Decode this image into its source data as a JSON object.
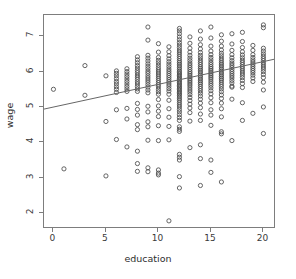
{
  "chart_data": {
    "type": "scatter",
    "title": "",
    "xlabel": "education",
    "ylabel": "wage",
    "xlim": [
      -0.9,
      21.2
    ],
    "ylim": [
      1.55,
      7.6
    ],
    "xticks": [
      0,
      5,
      10,
      15,
      20
    ],
    "yticks": [
      2,
      3,
      4,
      5,
      6,
      7
    ],
    "grid": false,
    "legend": null,
    "marker": {
      "shape": "open-circle",
      "size_px": 4.2,
      "color": "#4a4a4a"
    },
    "fit_line": {
      "kind": "linear-regression",
      "color": "#666666",
      "x_start": -0.9,
      "y_start": 4.94,
      "x_end": 21.2,
      "y_end": 6.36,
      "slope": 0.0643,
      "intercept": 4.998
    },
    "series": [
      {
        "name": "observations",
        "columns": [
          {
            "x": 0,
            "y": [
              5.5
            ]
          },
          {
            "x": 1,
            "y": [
              3.25
            ]
          },
          {
            "x": 3,
            "y": [
              6.17,
              5.33
            ]
          },
          {
            "x": 5,
            "y": [
              5.88,
              4.59,
              3.05
            ]
          },
          {
            "x": 6,
            "y": [
              6.02,
              5.95,
              5.88,
              5.8,
              5.72,
              5.65,
              5.57,
              5.5,
              5.41,
              4.92,
              4.08
            ]
          },
          {
            "x": 7,
            "y": [
              6.08,
              6.0,
              5.93,
              5.86,
              5.79,
              5.72,
              5.65,
              5.58,
              5.51,
              5.44,
              4.96,
              4.66,
              3.87
            ]
          },
          {
            "x": 8,
            "y": [
              6.42,
              6.33,
              6.25,
              6.17,
              6.1,
              6.03,
              5.97,
              5.9,
              5.84,
              5.78,
              5.71,
              5.65,
              5.58,
              5.51,
              5.44,
              5.1,
              4.93,
              4.77,
              4.5,
              4.36,
              3.75,
              3.4,
              3.18
            ]
          },
          {
            "x": 9,
            "y": [
              7.26,
              6.89,
              6.46,
              6.38,
              6.3,
              6.22,
              6.15,
              6.08,
              6.01,
              5.95,
              5.88,
              5.82,
              5.76,
              5.7,
              5.63,
              5.56,
              5.48,
              5.4,
              5.02,
              4.86,
              4.58,
              4.44,
              4.06,
              3.28,
              3.17
            ]
          },
          {
            "x": 10,
            "y": [
              6.79,
              6.55,
              6.4,
              6.32,
              6.25,
              6.18,
              6.11,
              6.05,
              5.99,
              5.93,
              5.87,
              5.81,
              5.75,
              5.69,
              5.63,
              5.57,
              5.5,
              5.43,
              5.36,
              5.21,
              5.03,
              4.88,
              4.73,
              4.47,
              4.05,
              3.22,
              3.13,
              3.08
            ]
          },
          {
            "x": 11,
            "y": [
              6.7,
              6.56,
              6.45,
              6.36,
              6.28,
              6.21,
              6.14,
              6.07,
              6.01,
              5.95,
              5.89,
              5.83,
              5.77,
              5.71,
              5.65,
              5.59,
              5.52,
              5.45,
              5.36,
              5.19,
              4.95,
              4.71,
              4.45,
              4.07,
              1.78
            ]
          },
          {
            "x": 12,
            "y": [
              7.22,
              7.15,
              7.07,
              6.98,
              6.9,
              6.82,
              6.75,
              6.68,
              6.61,
              6.55,
              6.49,
              6.43,
              6.37,
              6.31,
              6.26,
              6.21,
              6.16,
              6.11,
              6.06,
              6.01,
              5.97,
              5.93,
              5.89,
              5.85,
              5.81,
              5.77,
              5.73,
              5.69,
              5.65,
              5.61,
              5.57,
              5.53,
              5.49,
              5.45,
              5.41,
              5.37,
              5.33,
              5.28,
              5.23,
              5.18,
              5.12,
              5.06,
              5.0,
              4.93,
              4.86,
              4.78,
              4.7,
              4.62,
              4.44,
              4.37,
              4.31,
              3.66,
              3.58,
              3.5,
              3.03,
              2.71
            ]
          },
          {
            "x": 13,
            "y": [
              6.98,
              6.8,
              6.66,
              6.55,
              6.46,
              6.38,
              6.31,
              6.24,
              6.18,
              6.12,
              6.06,
              6.0,
              5.95,
              5.9,
              5.85,
              5.8,
              5.75,
              5.7,
              5.65,
              5.6,
              5.54,
              5.48,
              5.42,
              5.35,
              5.27,
              5.18,
              5.08,
              4.97,
              4.84,
              4.6,
              3.85
            ]
          },
          {
            "x": 14,
            "y": [
              7.15,
              6.92,
              6.76,
              6.64,
              6.54,
              6.46,
              6.39,
              6.32,
              6.26,
              6.2,
              6.14,
              6.09,
              6.04,
              5.99,
              5.94,
              5.89,
              5.84,
              5.79,
              5.74,
              5.69,
              5.64,
              5.58,
              5.52,
              5.46,
              5.39,
              5.31,
              5.22,
              5.11,
              4.98,
              4.8,
              4.62,
              3.93,
              3.54,
              2.78
            ]
          },
          {
            "x": 15,
            "y": [
              7.26,
              6.95,
              6.72,
              6.58,
              6.48,
              6.4,
              6.33,
              6.26,
              6.2,
              6.14,
              6.09,
              6.04,
              5.99,
              5.94,
              5.89,
              5.84,
              5.79,
              5.73,
              5.67,
              5.61,
              5.54,
              5.46,
              5.37,
              5.26,
              5.12,
              4.92,
              4.77,
              4.48,
              3.5,
              3.15
            ]
          },
          {
            "x": 16,
            "y": [
              7.04,
              6.86,
              6.72,
              6.61,
              6.52,
              6.45,
              6.38,
              6.32,
              6.26,
              6.21,
              6.16,
              6.11,
              6.06,
              6.01,
              5.96,
              5.91,
              5.86,
              5.81,
              5.76,
              5.7,
              5.64,
              5.58,
              5.51,
              5.43,
              5.34,
              5.24,
              5.11,
              4.95,
              4.72,
              4.3,
              4.24,
              2.88
            ]
          },
          {
            "x": 17,
            "y": [
              7.07,
              6.78,
              6.6,
              6.48,
              6.39,
              6.31,
              6.24,
              6.18,
              6.12,
              6.06,
              6.0,
              5.94,
              5.88,
              5.82,
              5.75,
              5.68,
              5.59,
              5.56,
              5.22,
              4.05
            ]
          },
          {
            "x": 18,
            "y": [
              7.11,
              6.85,
              6.68,
              6.56,
              6.47,
              6.39,
              6.32,
              6.26,
              6.2,
              6.14,
              6.08,
              6.02,
              5.96,
              5.9,
              5.83,
              5.75,
              5.66,
              5.55,
              5.12,
              4.62
            ]
          },
          {
            "x": 19,
            "y": [
              6.74,
              6.6,
              6.48,
              6.4,
              6.33,
              6.27,
              6.21,
              6.15,
              6.09,
              6.03,
              5.97,
              5.9,
              5.82,
              5.72,
              4.82
            ]
          },
          {
            "x": 20,
            "y": [
              7.32,
              7.24,
              6.66,
              6.58,
              6.5,
              6.43,
              6.37,
              6.31,
              6.25,
              6.19,
              6.13,
              6.07,
              6.0,
              5.92,
              5.83,
              5.7,
              5.48,
              5.0,
              4.25
            ]
          }
        ]
      }
    ]
  },
  "axes": {
    "y_tick_labels": [
      "7",
      "6",
      "5",
      "4",
      "3",
      "2"
    ],
    "x_tick_labels": [
      "0",
      "5",
      "10",
      "15",
      "20"
    ],
    "x_axis_title": "education",
    "y_axis_title": "wage"
  }
}
